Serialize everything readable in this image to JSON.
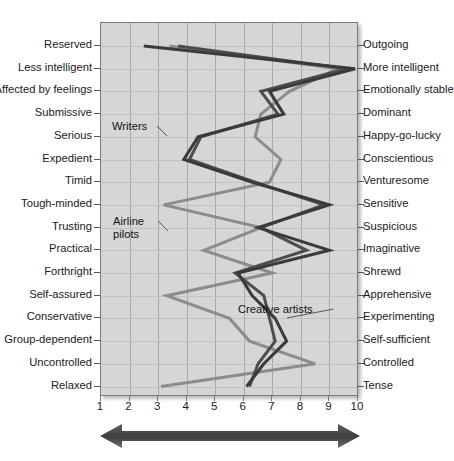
{
  "chart_data": {
    "type": "line",
    "title": "",
    "subtitle": "",
    "xlabel": "",
    "ylabel": "",
    "xlim": [
      1,
      10
    ],
    "xticks": [
      "1",
      "2",
      "3",
      "4",
      "5",
      "6",
      "7",
      "8",
      "9",
      "10"
    ],
    "grid": true,
    "legend_position": "inline-annotations",
    "orientation": "horizontal-profile",
    "categories": [
      "Reserved / Outgoing",
      "Less intelligent / More intelligent",
      "Affected by feelings / Emotionally stable",
      "Submissive / Dominant",
      "Serious / Happy-go-lucky",
      "Expedient / Conscientious",
      "Timid / Venturesome",
      "Tough-minded / Sensitive",
      "Trusting / Suspicious",
      "Practical / Imaginative",
      "Forthright / Shrewd",
      "Self-assured / Apprehensive",
      "Conservative / Experimenting",
      "Group-dependent / Self-sufficient",
      "Uncontrolled / Controlled",
      "Relaxed / Tense"
    ],
    "left_labels": [
      "Reserved",
      "Less intelligent",
      "Affected by feelings",
      "Submissive",
      "Serious",
      "Expedient",
      "Timid",
      "Tough-minded",
      "Trusting",
      "Practical",
      "Forthright",
      "Self-assured",
      "Conservative",
      "Group-dependent",
      "Uncontrolled",
      "Relaxed"
    ],
    "right_labels": [
      "Outgoing",
      "More intelligent",
      "Emotionally stable",
      "Dominant",
      "Happy-go-lucky",
      "Conscientious",
      "Venturesome",
      "Sensitive",
      "Suspicious",
      "Imaginative",
      "Shrewd",
      "Apprehensive",
      "Experimenting",
      "Self-sufficient",
      "Controlled",
      "Tense"
    ],
    "series": [
      {
        "name": "Writers",
        "color": "#3a3a3a",
        "values": [
          2.5,
          9.9,
          6.9,
          7.4,
          4.4,
          3.9,
          6.3,
          9.0,
          6.5,
          9.0,
          5.8,
          6.3,
          7.1,
          7.5,
          6.7,
          6.1
        ]
      },
      {
        "name": "Creative artists",
        "color": "#4d4d4d",
        "values": [
          3.7,
          9.6,
          6.6,
          7.2,
          4.5,
          4.1,
          6.4,
          8.8,
          6.6,
          8.2,
          5.7,
          6.7,
          6.9,
          7.1,
          6.5,
          6.2
        ]
      },
      {
        "name": "Airline pilots",
        "color": "#8c8c8c",
        "values": [
          3.4,
          9.3,
          7.6,
          6.6,
          6.4,
          7.3,
          6.9,
          3.2,
          6.6,
          4.6,
          7.0,
          3.3,
          5.5,
          6.2,
          8.5,
          3.1
        ]
      }
    ],
    "annotations": [
      {
        "text": "Writers",
        "x_px": 112,
        "y_px": 120
      },
      {
        "text": "Airline\npilots",
        "x_px": 113,
        "y_px": 215
      },
      {
        "text": "Creative artists",
        "x_px": 238,
        "y_px": 303
      }
    ],
    "direction_arrow": {
      "name": "bidirectional-scale-arrow",
      "description": "double-headed horizontal arrow under the x-axis",
      "color": "#4a4a4a"
    }
  },
  "style": {
    "plot_background": "#d6d6d6",
    "grid_color": "#a9a9a9",
    "text_color": "#1a1a1a",
    "page_background": "#ffffff"
  }
}
